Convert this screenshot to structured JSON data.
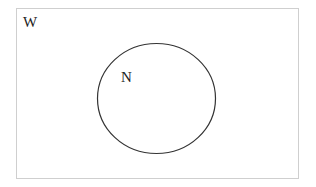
{
  "diagram": {
    "type": "venn",
    "universe": {
      "label": "W"
    },
    "sets": [
      {
        "label": "N"
      }
    ],
    "colors": {
      "stroke": "#333333",
      "frame": "#cccccc",
      "background": "#ffffff"
    }
  }
}
